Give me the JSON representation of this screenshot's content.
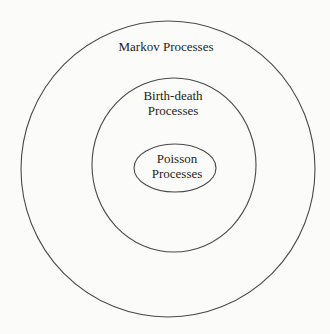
{
  "diagram": {
    "type": "nested-set (Euler) diagram",
    "sets": [
      {
        "id": "markov",
        "label": "Markov Processes",
        "shape": "circle",
        "cx": 168,
        "cy": 169,
        "rx": 147,
        "ry": 148,
        "contains": [
          "birth-death"
        ]
      },
      {
        "id": "birth-death",
        "label_line1": "Birth-death",
        "label_line2": "Processes",
        "shape": "circle",
        "cx": 174,
        "cy": 165,
        "rx": 82,
        "ry": 87,
        "contains": [
          "poisson"
        ]
      },
      {
        "id": "poisson",
        "label_line1": "Poisson",
        "label_line2": "Processes",
        "shape": "ellipse",
        "cx": 175,
        "cy": 168,
        "rx": 41,
        "ry": 24,
        "contains": []
      }
    ],
    "colors": {
      "stroke": "#4a4a4a",
      "text": "#1e1e1e",
      "background": "#fbfbfa"
    }
  }
}
